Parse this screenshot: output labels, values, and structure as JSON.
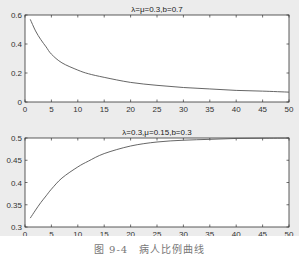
{
  "caption": "图 9-4　病人比例曲线",
  "chart_data": [
    {
      "type": "line",
      "title": "λ=μ=0.3,b=0.7",
      "xlabel": "",
      "ylabel": "",
      "xlim": [
        0,
        50
      ],
      "ylim": [
        0,
        0.6
      ],
      "xticks": [
        0,
        5,
        10,
        15,
        20,
        25,
        30,
        35,
        40,
        45,
        50
      ],
      "yticks": [
        0,
        0.2,
        0.4,
        0.6
      ],
      "ytick_labels": [
        "0",
        "0.2",
        "0.4",
        "0.6"
      ],
      "grid": false,
      "x": [
        1,
        2,
        3,
        4,
        5,
        7,
        10,
        12,
        15,
        20,
        25,
        30,
        35,
        40,
        45,
        50
      ],
      "series": [
        {
          "name": "i(t)",
          "values": [
            0.57,
            0.49,
            0.43,
            0.38,
            0.33,
            0.27,
            0.22,
            0.195,
            0.17,
            0.135,
            0.115,
            0.1,
            0.09,
            0.08,
            0.075,
            0.068
          ]
        }
      ]
    },
    {
      "type": "line",
      "title": "λ=0.3,μ=0.15,b=0.3",
      "xlabel": "",
      "ylabel": "",
      "xlim": [
        0,
        50
      ],
      "ylim": [
        0.3,
        0.5
      ],
      "xticks": [
        0,
        5,
        10,
        15,
        20,
        25,
        30,
        35,
        40,
        45,
        50
      ],
      "yticks": [
        0.3,
        0.35,
        0.4,
        0.45,
        0.5
      ],
      "ytick_labels": [
        "0.3",
        "0.35",
        "0.4",
        "0.45",
        "0.5"
      ],
      "grid": false,
      "x": [
        1,
        2,
        3,
        4,
        5,
        7,
        10,
        12,
        15,
        20,
        25,
        30,
        35,
        40,
        45,
        50
      ],
      "series": [
        {
          "name": "i(t)",
          "values": [
            0.32,
            0.338,
            0.355,
            0.37,
            0.385,
            0.41,
            0.435,
            0.448,
            0.465,
            0.482,
            0.491,
            0.495,
            0.497,
            0.499,
            0.4995,
            0.4998
          ]
        }
      ]
    }
  ]
}
